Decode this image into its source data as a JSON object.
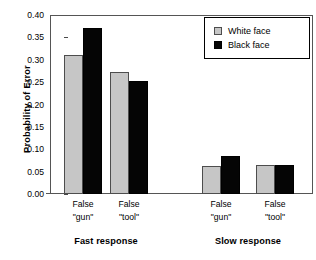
{
  "chart_data": {
    "type": "bar",
    "title": "",
    "subtitle": "",
    "xlabel": "",
    "ylabel": "Probability of Error",
    "ylim": [
      0.0,
      0.4
    ],
    "ytick_labels": [
      "0.40",
      "0.35",
      "0.30",
      "0.25",
      "0.20",
      "0.15",
      "0.10",
      "0.05",
      "0.00"
    ],
    "ytick_values": [
      0.4,
      0.35,
      0.3,
      0.25,
      0.2,
      0.15,
      0.1,
      0.05,
      0.0
    ],
    "grid": false,
    "legend_position": "top-right-inside",
    "categories": [
      "False \"gun\"",
      "False \"tool\"",
      "False \"gun\"",
      "False \"tool\""
    ],
    "category_lines": [
      [
        "False",
        "\"gun\""
      ],
      [
        "False",
        "\"tool\""
      ],
      [
        "False",
        "\"gun\""
      ],
      [
        "False",
        "\"tool\""
      ]
    ],
    "group_labels": [
      "Fast response",
      "Slow response"
    ],
    "series": [
      {
        "name": "White face",
        "color": "#c6c6c6",
        "values": [
          0.31,
          0.272,
          0.063,
          0.064
        ]
      },
      {
        "name": "Black face",
        "color": "#050505",
        "values": [
          0.371,
          0.252,
          0.085,
          0.064
        ]
      }
    ]
  }
}
